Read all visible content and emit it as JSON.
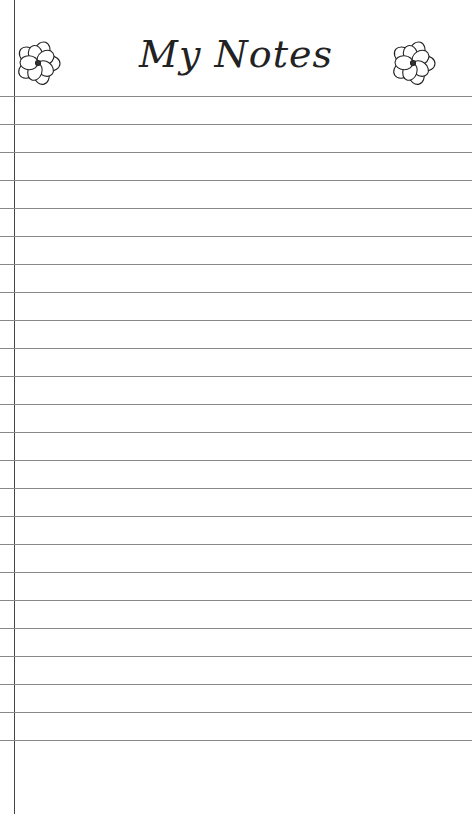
{
  "header": {
    "title": "My Notes",
    "left_icon": "flower-icon",
    "right_icon": "flower-icon"
  },
  "ruled_lines": {
    "count": 24,
    "first_y": 96,
    "spacing": 28,
    "color": "#888888"
  },
  "margin_line": {
    "x": 14,
    "color": "#444444"
  }
}
